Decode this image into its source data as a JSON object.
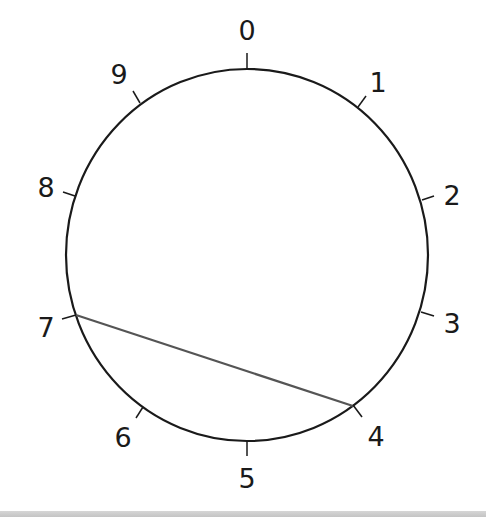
{
  "diagram": {
    "type": "circle-with-numbered-points",
    "center": [
      247,
      255
    ],
    "radius_x": 181,
    "radius_y": 186,
    "stroke_color": "#1a1a1a",
    "chord_color": "#555555",
    "points": [
      {
        "label": "0",
        "tick": [
          [
            247,
            53
          ],
          [
            247,
            69
          ]
        ],
        "label_pos": [
          247,
          40
        ]
      },
      {
        "label": "1",
        "tick": [
          [
            366,
            96
          ],
          [
            358,
            107
          ]
        ],
        "label_pos": [
          378,
          92
        ]
      },
      {
        "label": "2",
        "tick": [
          [
            434,
            196
          ],
          [
            422,
            200
          ]
        ],
        "label_pos": [
          452,
          205
        ]
      },
      {
        "label": "3",
        "tick": [
          [
            434,
            316
          ],
          [
            421,
            312
          ]
        ],
        "label_pos": [
          452,
          333
        ]
      },
      {
        "label": "4",
        "tick": [
          [
            362,
            417
          ],
          [
            353,
            405
          ]
        ],
        "label_pos": [
          376,
          446
        ]
      },
      {
        "label": "5",
        "tick": [
          [
            247,
            441
          ],
          [
            247,
            456
          ]
        ],
        "label_pos": [
          247,
          488
        ]
      },
      {
        "label": "6",
        "tick": [
          [
            136,
            418
          ],
          [
            143,
            407
          ]
        ],
        "label_pos": [
          123,
          447
        ]
      },
      {
        "label": "7",
        "tick": [
          [
            62,
            319
          ],
          [
            76,
            315
          ]
        ],
        "label_pos": [
          46,
          337
        ]
      },
      {
        "label": "8",
        "tick": [
          [
            63,
            192
          ],
          [
            75,
            196
          ]
        ],
        "label_pos": [
          46,
          197
        ]
      },
      {
        "label": "9",
        "tick": [
          [
            133,
            91
          ],
          [
            140,
            103
          ]
        ],
        "label_pos": [
          119,
          84
        ]
      }
    ],
    "chords": [
      {
        "from": "7",
        "to": "4",
        "x1": 76,
        "y1": 315,
        "x2": 353,
        "y2": 406
      }
    ]
  }
}
